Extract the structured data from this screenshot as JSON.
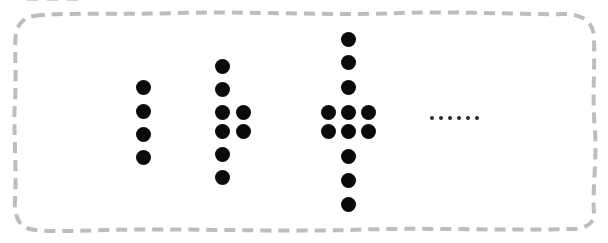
{
  "figure": {
    "caption_fragment": "— — —",
    "background_color": "#ffffff",
    "dot_color": "#0b0b0b",
    "border_color": "#bdbdbd",
    "border_style": "dashed-rounded-hand-drawn",
    "ellipsis_label": "......",
    "ellipsis_dot_count": 6
  },
  "chart_data": {
    "type": "scatter",
    "title": "",
    "subtitle": "",
    "xlabel": "",
    "ylabel": "",
    "grid": false,
    "legend": null,
    "categories": [
      "Figure 1",
      "Figure 2",
      "Figure 3",
      "Figure 4 (implied)"
    ],
    "values": [
      4,
      8,
      12,
      null
    ],
    "annotations": [
      "......"
    ],
    "groups": [
      {
        "name": "figure-1",
        "dot_count": 4,
        "rows": 4,
        "columns": 1,
        "points": [
          {
            "x": 143,
            "y": 87
          },
          {
            "x": 143,
            "y": 111
          },
          {
            "x": 143,
            "y": 134
          },
          {
            "x": 143,
            "y": 157
          }
        ]
      },
      {
        "name": "figure-2",
        "dot_count": 8,
        "rows": 6,
        "columns": 2,
        "points": [
          {
            "x": 222,
            "y": 66
          },
          {
            "x": 222,
            "y": 89
          },
          {
            "x": 222,
            "y": 112
          },
          {
            "x": 243,
            "y": 112
          },
          {
            "x": 222,
            "y": 131
          },
          {
            "x": 243,
            "y": 131
          },
          {
            "x": 222,
            "y": 154
          },
          {
            "x": 222,
            "y": 177
          }
        ]
      },
      {
        "name": "figure-3",
        "dot_count": 12,
        "rows": 8,
        "columns": 3,
        "points": [
          {
            "x": 348,
            "y": 39
          },
          {
            "x": 348,
            "y": 62
          },
          {
            "x": 348,
            "y": 87
          },
          {
            "x": 328,
            "y": 112
          },
          {
            "x": 348,
            "y": 112
          },
          {
            "x": 368,
            "y": 112
          },
          {
            "x": 328,
            "y": 131
          },
          {
            "x": 348,
            "y": 131
          },
          {
            "x": 368,
            "y": 131
          },
          {
            "x": 348,
            "y": 156
          },
          {
            "x": 348,
            "y": 180
          },
          {
            "x": 348,
            "y": 204
          }
        ]
      }
    ]
  }
}
